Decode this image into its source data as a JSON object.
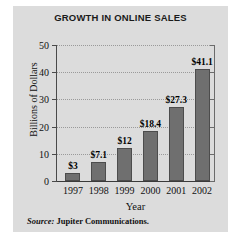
{
  "chart_data": {
    "type": "bar",
    "title": "GROWTH IN ONLINE SALES",
    "xlabel": "Year",
    "ylabel": "Billions of Dollars",
    "categories": [
      "1997",
      "1998",
      "1999",
      "2000",
      "2001",
      "2002"
    ],
    "values": [
      3,
      7.1,
      12,
      18.4,
      27.3,
      41.1
    ],
    "data_labels": [
      "$3",
      "$7.1",
      "$12",
      "$18.4",
      "$27.3",
      "$41.1"
    ],
    "ylim": [
      0,
      50
    ],
    "yticks": [
      0,
      10,
      20,
      30,
      40,
      50
    ],
    "ytick_labels": [
      "0",
      "10",
      "20",
      "30",
      "40",
      "50"
    ],
    "grid": true,
    "grid_style": "dotted-horizontal",
    "legend": null,
    "bar_color": "#6f6f6f",
    "bar_edge_color": "#4c4c4c",
    "panel_color": "#dcdcdc",
    "gridline_color": "#9a9a9a",
    "axis_color": "#4a4a4a"
  },
  "source": {
    "label": "Source:",
    "text": "Jupiter Communications."
  }
}
